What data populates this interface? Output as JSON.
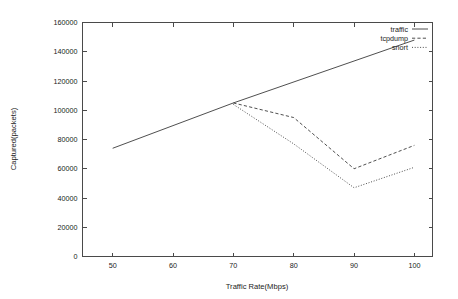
{
  "chart_data": {
    "type": "line",
    "title": "",
    "xlabel": "Traffic Rate(Mbps)",
    "ylabel": "Captured(packets)",
    "x": [
      50,
      60,
      70,
      80,
      90,
      100
    ],
    "xlim": [
      45,
      103
    ],
    "ylim": [
      0,
      160000
    ],
    "xticks": [
      50,
      60,
      70,
      80,
      90,
      100
    ],
    "yticks": [
      0,
      20000,
      40000,
      60000,
      80000,
      100000,
      120000,
      140000,
      160000
    ],
    "xtick_labels": [
      "50",
      "60",
      "70",
      "80",
      "90",
      "100"
    ],
    "ytick_labels": [
      "0",
      "20000",
      "40000",
      "60000",
      "80000",
      "100000",
      "120000",
      "140000",
      "160000"
    ],
    "grid": false,
    "legend_position": "top-right-inside",
    "series": [
      {
        "name": "traffic",
        "style": "solid",
        "x": [
          50,
          70,
          100
        ],
        "values": [
          74000,
          105000,
          148000
        ]
      },
      {
        "name": "tcpdump",
        "style": "dashed",
        "x": [
          70,
          80,
          90,
          100
        ],
        "values": [
          105000,
          95000,
          60000,
          76000
        ]
      },
      {
        "name": "snort",
        "style": "dotted",
        "x": [
          70,
          80,
          90,
          100
        ],
        "values": [
          104000,
          77000,
          47000,
          61000
        ]
      }
    ]
  },
  "legend": {
    "items": [
      {
        "label": "traffic",
        "style": "solid"
      },
      {
        "label": "tcpdump",
        "style": "dashed"
      },
      {
        "label": "snort",
        "style": "dotted"
      }
    ]
  }
}
